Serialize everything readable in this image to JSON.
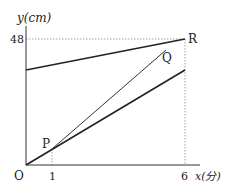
{
  "diagram": {
    "axes": {
      "y_label": "y(cm)",
      "x_label": "x(分)",
      "origin_label": "O"
    },
    "ticks": {
      "y_48": "48",
      "x_1": "1",
      "x_6": "6"
    },
    "points": {
      "P": "P",
      "Q": "Q",
      "R": "R"
    },
    "colors": {
      "line": "#222222",
      "dotted": "#888888"
    }
  }
}
